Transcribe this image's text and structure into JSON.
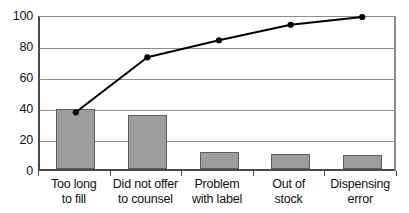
{
  "chart_data": {
    "type": "bar",
    "title": "",
    "subtitle": "",
    "xlabel": "",
    "ylabel": "",
    "ylim": [
      0,
      100
    ],
    "yticks": [
      0,
      20,
      40,
      60,
      80,
      100
    ],
    "grid": true,
    "legend": false,
    "legend_position": "none",
    "categories": [
      "Too long to fill",
      "Did not offer to counsel",
      "Problem with label",
      "Out of stock",
      "Dispensing error"
    ],
    "category_lines": [
      [
        "Too long",
        "to fill"
      ],
      [
        "Did not offer",
        "to counsel"
      ],
      [
        "Problem",
        "with label"
      ],
      [
        "Out of",
        "stock"
      ],
      [
        "Dispensing",
        "error"
      ]
    ],
    "series": [
      {
        "name": "Count",
        "type": "bar",
        "values": [
          38.5,
          35,
          11,
          10,
          9
        ]
      },
      {
        "name": "Cumulative percentage",
        "type": "line",
        "values": [
          38.5,
          74,
          85,
          95,
          100
        ]
      }
    ],
    "colors": {
      "bar_fill": "#9d9d9d",
      "bar_border": "#5d5d5d",
      "line": "#000000",
      "marker": "#000000",
      "grid": "#8d8d8d",
      "axis": "#4a4a4a",
      "background": "#ffffff",
      "text": "#111111"
    }
  },
  "axis": {
    "y_tick_labels": [
      "100",
      "80",
      "60",
      "40",
      "20",
      "0"
    ]
  }
}
